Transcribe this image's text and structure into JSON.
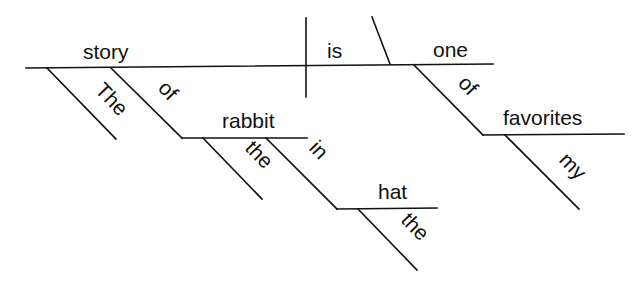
{
  "diagram": {
    "type": "reed-kellogg-sentence-diagram",
    "sentence": "The story of the rabbit in the hat is one of my favorites",
    "colors": {
      "line": "#111111",
      "text": "#111111",
      "background": "#ffffff"
    },
    "baseline": {
      "subject": "story",
      "verb": "is",
      "complement": "one",
      "divider_subject_verb": "vertical-bar",
      "divider_verb_complement": "slanted-line"
    },
    "modifiers": {
      "story_article": "The",
      "story_preposition": "of",
      "story_prep_object": "rabbit",
      "rabbit_article": "the",
      "rabbit_preposition": "in",
      "rabbit_prep_object": "hat",
      "hat_article": "the",
      "one_preposition": "of",
      "one_prep_object": "favorites",
      "favorites_possessive": "my"
    }
  }
}
